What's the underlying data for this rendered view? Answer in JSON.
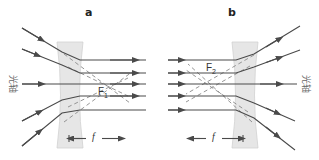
{
  "panels": [
    {
      "id": "a",
      "label": "a",
      "focal_point": {
        "symbol": "F",
        "subscript": "1"
      },
      "focal_length_symbol": "f",
      "axis_label": "光轴"
    },
    {
      "id": "b",
      "label": "b",
      "focal_point": {
        "symbol": "F",
        "subscript": "2"
      },
      "focal_length_symbol": "f",
      "axis_label": "光轴"
    }
  ],
  "colors": {
    "ray": "#4a4a4a",
    "construction_line": "#8a8a8a",
    "lens_fill": "#e6e6e6",
    "lens_stroke": "#cfcfcf",
    "text": "#333333"
  }
}
